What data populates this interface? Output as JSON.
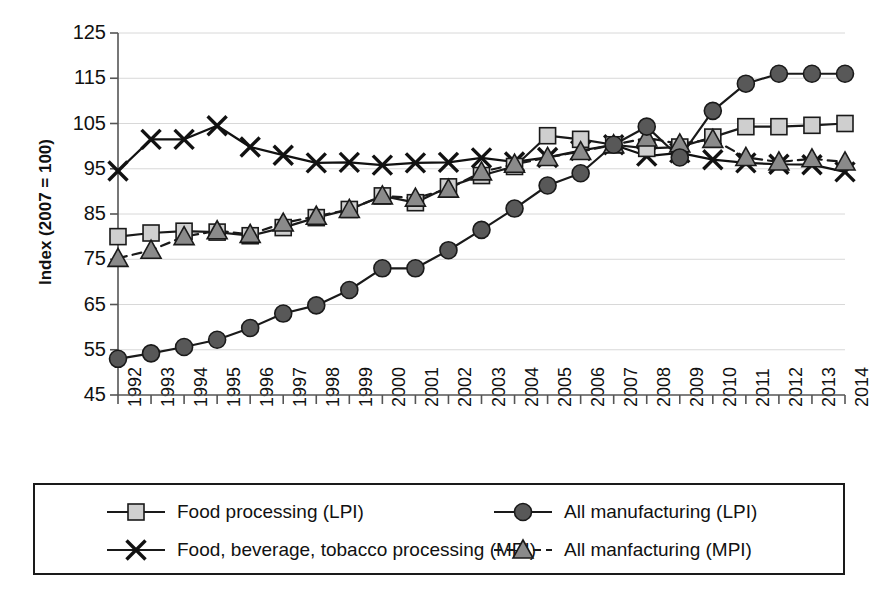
{
  "chart_data": {
    "type": "line",
    "title": "",
    "xlabel": "",
    "ylabel": "Index (2007 = 100)",
    "ylim": [
      45,
      125
    ],
    "yticks": [
      45,
      55,
      65,
      75,
      85,
      95,
      105,
      115,
      125
    ],
    "grid": true,
    "legend_position": "bottom",
    "x": [
      1992,
      1993,
      1994,
      1995,
      1996,
      1997,
      1998,
      1999,
      2000,
      2001,
      2002,
      2003,
      2004,
      2005,
      2006,
      2007,
      2008,
      2009,
      2010,
      2011,
      2012,
      2013,
      2014
    ],
    "categories": [
      "1992",
      "1993",
      "1994",
      "1995",
      "1996",
      "1997",
      "1998",
      "1999",
      "2000",
      "2001",
      "2002",
      "2003",
      "2004",
      "2005",
      "2006",
      "2007",
      "2008",
      "2009",
      "2010",
      "2011",
      "2012",
      "2013",
      "2014"
    ],
    "series": [
      {
        "name": "Food processing (LPI)",
        "key": "food_lpi",
        "marker": "square",
        "linestyle": "solid",
        "color": "#1a1a1a",
        "marker_fill": "#cfcfcf",
        "values": [
          80.0,
          80.8,
          81.2,
          81.0,
          80.2,
          82.0,
          84.2,
          86.0,
          89.0,
          87.5,
          91.0,
          93.5,
          95.5,
          102.3,
          101.5,
          100.3,
          99.5,
          99.8,
          102.0,
          104.3,
          104.3,
          104.6,
          105.0
        ]
      },
      {
        "name": "Food, beverage, tobacco processing (MPI)",
        "key": "food_mpi",
        "marker": "cross",
        "linestyle": "solid",
        "color": "#111111",
        "marker_fill": "#111111",
        "values": [
          94.5,
          101.5,
          101.5,
          104.5,
          99.8,
          98.0,
          96.3,
          96.4,
          95.8,
          96.3,
          96.4,
          97.4,
          96.5,
          97.5,
          99.0,
          100.3,
          97.8,
          98.5,
          97.0,
          96.3,
          96.0,
          95.9,
          94.3
        ]
      },
      {
        "name": "All manufacturing (LPI)",
        "key": "all_lpi",
        "marker": "circle",
        "linestyle": "solid",
        "color": "#1a1a1a",
        "marker_fill": "#585858",
        "values": [
          53.0,
          54.2,
          55.6,
          57.2,
          59.8,
          63.0,
          64.8,
          68.2,
          73.0,
          73.0,
          77.0,
          81.5,
          86.2,
          91.3,
          94.0,
          100.3,
          104.3,
          97.5,
          107.8,
          113.8,
          116.0,
          116.0,
          116.0
        ]
      },
      {
        "name": "All manfacturing (MPI)",
        "key": "all_mpi",
        "marker": "triangle",
        "linestyle": "dashed",
        "color": "#1a1a1a",
        "marker_fill": "#8a8a8a",
        "values": [
          75.2,
          77.0,
          80.0,
          81.3,
          80.5,
          83.0,
          84.5,
          86.0,
          89.0,
          88.5,
          90.5,
          94.3,
          96.0,
          97.5,
          98.8,
          100.3,
          101.8,
          100.5,
          101.5,
          97.5,
          96.5,
          97.2,
          96.5
        ]
      }
    ],
    "legend": [
      {
        "label": "Food processing (LPI)",
        "marker": "square",
        "linestyle": "solid"
      },
      {
        "label": "Food, beverage, tobacco processing (MPI)",
        "marker": "cross",
        "linestyle": "solid"
      },
      {
        "label": "All manufacturing (LPI)",
        "marker": "circle",
        "linestyle": "solid"
      },
      {
        "label": "All manfacturing (MPI)",
        "marker": "triangle",
        "linestyle": "dashed"
      }
    ],
    "colors": {
      "axis": "#555555",
      "grid": "#d8d8d8",
      "line": "#1a1a1a",
      "square_fill": "#cfcfcf",
      "circle_fill": "#585858",
      "triangle_fill": "#8a8a8a",
      "cross": "#111111",
      "text": "#111111",
      "legend_border": "#1a1a1a",
      "background": "#ffffff"
    }
  }
}
